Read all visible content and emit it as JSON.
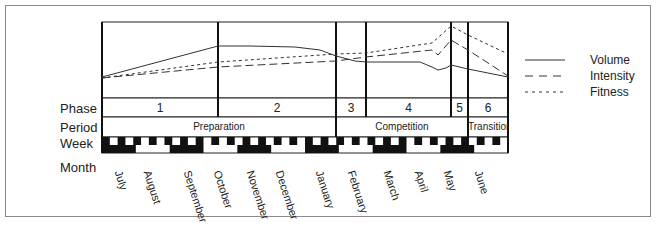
{
  "chart_data": {
    "type": "line",
    "title": "",
    "xlabel": "",
    "ylabel": "",
    "categories": [
      "July",
      "August",
      "September",
      "October",
      "November",
      "December",
      "January",
      "February",
      "March",
      "April",
      "May",
      "June"
    ],
    "series": [
      {
        "name": "Volume",
        "style": "solid",
        "values": [
          30,
          48,
          62,
          75,
          75,
          73,
          68,
          58,
          55,
          55,
          48,
          38
        ]
      },
      {
        "name": "Intensity",
        "style": "dashed",
        "values": [
          30,
          36,
          40,
          45,
          48,
          50,
          52,
          55,
          60,
          65,
          85,
          40
        ]
      },
      {
        "name": "Fitness",
        "style": "dotted",
        "values": [
          32,
          40,
          46,
          52,
          55,
          57,
          60,
          62,
          68,
          72,
          95,
          60
        ]
      }
    ],
    "rows": {
      "phase": [
        "1",
        "2",
        "3",
        "4",
        "5",
        "6"
      ],
      "period": [
        "Preparation",
        "Competition",
        "Transition"
      ]
    },
    "legend_position": "right",
    "grid": false
  },
  "labels": {
    "phase": "Phase",
    "period": "Period",
    "week": "Week",
    "month": "Month"
  },
  "legend": {
    "volume": "Volume",
    "intensity": "Intensity",
    "fitness": "Fitness"
  },
  "phases": [
    "1",
    "2",
    "3",
    "4",
    "5",
    "6"
  ],
  "periods": {
    "preparation": "Preparation",
    "competition": "Competition",
    "transition": "Transition"
  },
  "months": [
    "July",
    "August",
    "September",
    "October",
    "November",
    "December",
    "January",
    "February",
    "March",
    "April",
    "May",
    "June"
  ]
}
